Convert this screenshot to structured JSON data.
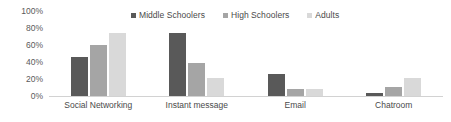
{
  "chart_data": {
    "type": "bar",
    "title": "",
    "subtitle": "",
    "xlabel": "",
    "ylabel": "",
    "ylim": [
      0,
      100
    ],
    "y_ticks": [
      "0%",
      "20%",
      "40%",
      "60%",
      "80%",
      "100%"
    ],
    "y_tick_values": [
      0,
      20,
      40,
      60,
      80,
      100
    ],
    "grid": false,
    "legend_position": "top-center",
    "value_suffix": "%",
    "categories": [
      "Social Networking",
      "Instant message",
      "Email",
      "Chatroom"
    ],
    "series": [
      {
        "name": "Middle Schoolers",
        "color": "#595959",
        "values": [
          46,
          74,
          26,
          4
        ]
      },
      {
        "name": "High Schoolers",
        "color": "#a5a5a5",
        "values": [
          60,
          39,
          8,
          11
        ]
      },
      {
        "name": "Adults",
        "color": "#d9d9d9",
        "values": [
          74,
          21,
          8,
          21
        ]
      }
    ]
  },
  "axis": {
    "baseline_color": "#d2d2d2",
    "tick_label_color": "#5a5a5a"
  },
  "legend": {
    "items": [
      {
        "label": "Middle Schoolers",
        "swatch_name": "legend-swatch-middle-schoolers"
      },
      {
        "label": "High Schoolers",
        "swatch_name": "legend-swatch-high-schoolers"
      },
      {
        "label": "Adults",
        "swatch_name": "legend-swatch-adults"
      }
    ]
  }
}
